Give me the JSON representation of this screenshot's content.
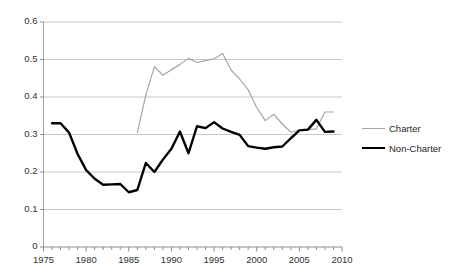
{
  "chart_data": {
    "type": "line",
    "title": "",
    "xlabel": "",
    "ylabel": "",
    "xlim": [
      1975,
      2010
    ],
    "ylim": [
      0,
      0.6
    ],
    "grid": true,
    "legend_position": "right",
    "x_ticks": [
      1975,
      1980,
      1985,
      1990,
      1995,
      2000,
      2005,
      2010
    ],
    "x_tick_labels": [
      "1975",
      "1980",
      "1985",
      "1990",
      "1995",
      "2000",
      "2005",
      "2010"
    ],
    "x_minor_tick_step": 1,
    "y_ticks": [
      0,
      0.1,
      0.2,
      0.3,
      0.4,
      0.5,
      0.6
    ],
    "y_tick_labels": [
      "0",
      "0.1",
      "0.2",
      "0.3",
      "0.4",
      "0.5",
      "0.6"
    ],
    "series": [
      {
        "name": "Charter",
        "color": "#a6a6a6",
        "line_width": 1.2,
        "x": [
          1986,
          1987,
          1988,
          1989,
          1990,
          1991,
          1992,
          1993,
          1994,
          1995,
          1996,
          1997,
          1998,
          1999,
          2000,
          2001,
          2002,
          2003,
          2004,
          2005,
          2006,
          2007,
          2008,
          2009
        ],
        "values": [
          0.305,
          0.405,
          0.481,
          0.458,
          0.473,
          0.487,
          0.503,
          0.492,
          0.497,
          0.502,
          0.516,
          0.472,
          0.448,
          0.419,
          0.372,
          0.337,
          0.354,
          0.328,
          0.306,
          0.312,
          0.313,
          0.315,
          0.36,
          0.36
        ]
      },
      {
        "name": "Non-Charter",
        "color": "#000000",
        "line_width": 2.4,
        "x": [
          1976,
          1977,
          1978,
          1979,
          1980,
          1981,
          1982,
          1983,
          1984,
          1985,
          1986,
          1987,
          1988,
          1989,
          1990,
          1991,
          1992,
          1993,
          1994,
          1995,
          1996,
          1997,
          1998,
          1999,
          2000,
          2001,
          2002,
          2003,
          2004,
          2005,
          2006,
          2007,
          2008,
          2009
        ],
        "values": [
          0.33,
          0.33,
          0.305,
          0.248,
          0.205,
          0.182,
          0.166,
          0.167,
          0.168,
          0.146,
          0.152,
          0.224,
          0.2,
          0.233,
          0.262,
          0.308,
          0.25,
          0.322,
          0.317,
          0.333,
          0.316,
          0.307,
          0.299,
          0.269,
          0.265,
          0.262,
          0.266,
          0.268,
          0.29,
          0.311,
          0.313,
          0.339,
          0.307,
          0.308
        ]
      }
    ]
  },
  "legend": {
    "items": [
      {
        "label": "Charter"
      },
      {
        "label": "Non-Charter"
      }
    ]
  }
}
